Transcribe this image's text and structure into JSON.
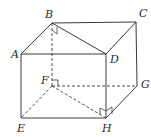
{
  "diagram": {
    "type": "cuboid",
    "vertices": {
      "A": {
        "label": "A",
        "x": 21,
        "y": 54,
        "lx": 11,
        "ly": 58
      },
      "B": {
        "label": "B",
        "x": 52,
        "y": 23,
        "lx": 45,
        "ly": 18
      },
      "C": {
        "label": "C",
        "x": 136,
        "y": 22,
        "lx": 139,
        "ly": 17
      },
      "D": {
        "label": "D",
        "x": 106,
        "y": 54,
        "lx": 110,
        "ly": 63
      },
      "E": {
        "label": "E",
        "x": 21,
        "y": 118,
        "lx": 17,
        "ly": 132
      },
      "F": {
        "label": "F",
        "x": 52,
        "y": 86,
        "lx": 41,
        "ly": 84
      },
      "G": {
        "label": "G",
        "x": 137,
        "y": 86,
        "lx": 141,
        "ly": 88
      },
      "H": {
        "label": "H",
        "x": 106,
        "y": 118,
        "lx": 102,
        "ly": 132
      }
    },
    "solid_edges": [
      [
        "A",
        "B"
      ],
      [
        "B",
        "C"
      ],
      [
        "C",
        "D"
      ],
      [
        "D",
        "A"
      ],
      [
        "B",
        "D"
      ],
      [
        "A",
        "E"
      ],
      [
        "E",
        "H"
      ],
      [
        "H",
        "D"
      ],
      [
        "C",
        "G"
      ],
      [
        "G",
        "H"
      ]
    ],
    "dashed_edges": [
      [
        "B",
        "F"
      ],
      [
        "F",
        "G"
      ],
      [
        "F",
        "E"
      ],
      [
        "F",
        "H"
      ]
    ],
    "right_angle_marks": [
      {
        "at": "B",
        "description": "angle between BF and BD"
      },
      {
        "at": "F",
        "description": "angle between FB and FG"
      },
      {
        "at": "H",
        "description": "angles at H between HD and HF, HD and HG"
      }
    ],
    "colors": {
      "line": "#3a3a3a",
      "label": "#2a2a2a",
      "background": "#ffffff"
    }
  }
}
